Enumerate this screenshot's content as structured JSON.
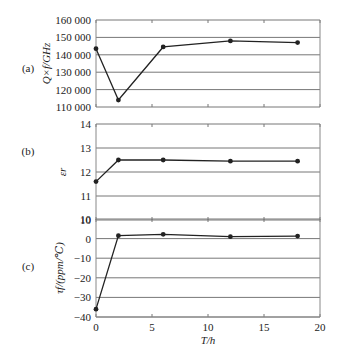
{
  "chart_data": [
    {
      "type": "line",
      "panel_label": "(a)",
      "ylabel": "Q×f/GHz",
      "xlabel": "T/h",
      "ylim": [
        110000,
        160000
      ],
      "yticks": [
        110000,
        120000,
        130000,
        140000,
        150000,
        160000
      ],
      "ytick_labels": [
        "110 000",
        "120 000",
        "130 000",
        "140 000",
        "150 000",
        "160 000"
      ],
      "x": [
        0,
        2,
        6,
        12,
        18
      ],
      "values": [
        143500,
        114000,
        144500,
        148000,
        147000
      ],
      "grid": true
    },
    {
      "type": "line",
      "panel_label": "(b)",
      "ylabel": "εr",
      "xlabel": "T/h",
      "ylim": [
        10,
        14
      ],
      "yticks": [
        10,
        11,
        12,
        13,
        14
      ],
      "ytick_labels": [
        "10",
        "11",
        "12",
        "13",
        "14"
      ],
      "x": [
        0,
        2,
        6,
        12,
        18
      ],
      "values": [
        11.6,
        12.5,
        12.5,
        12.45,
        12.45
      ],
      "grid": true
    },
    {
      "type": "line",
      "panel_label": "(c)",
      "ylabel": "τf/(ppm/℃)",
      "xlabel": "T/h",
      "ylim": [
        -40,
        10
      ],
      "yticks": [
        -40,
        -30,
        -20,
        -10,
        0,
        10
      ],
      "ytick_labels": [
        "−40",
        "−30",
        "−20",
        "−10",
        "0",
        "10"
      ],
      "x": [
        0,
        2,
        6,
        12,
        18
      ],
      "values": [
        -36,
        1.5,
        2.2,
        1.0,
        1.3
      ],
      "grid": true
    }
  ],
  "xaxis": {
    "label": "T/h",
    "xlim": [
      0,
      20
    ],
    "ticks": [
      0,
      5,
      10,
      15,
      20
    ],
    "tick_labels": [
      "0",
      "5",
      "10",
      "15",
      "20"
    ]
  },
  "colors": {
    "line": "#222222",
    "grid": "#777777",
    "frame": "#888888"
  }
}
